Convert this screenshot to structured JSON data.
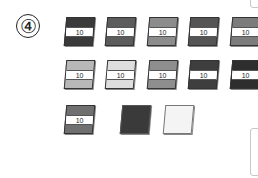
{
  "problem": {
    "number_label": "④"
  },
  "rows": [
    {
      "cards": [
        {
          "label": "10",
          "color": "#3a3a3a",
          "x": 65,
          "y": 17
        },
        {
          "label": "10",
          "color": "#5c5c5c",
          "x": 106,
          "y": 17
        },
        {
          "label": "10",
          "color": "#8c8c8c",
          "x": 148,
          "y": 17
        },
        {
          "label": "10",
          "color": "#555555",
          "x": 189,
          "y": 17
        },
        {
          "label": "10",
          "color": "#7c7c7c",
          "x": 231,
          "y": 17
        }
      ]
    },
    {
      "cards": [
        {
          "label": "10",
          "color": "#b8b8b8",
          "x": 65,
          "y": 60
        },
        {
          "label": "10",
          "color": "#dedede",
          "x": 106,
          "y": 60
        },
        {
          "label": "10",
          "color": "#8e8e8e",
          "x": 148,
          "y": 60
        },
        {
          "label": "10",
          "color": "#3e3e3e",
          "x": 189,
          "y": 60
        },
        {
          "label": "10",
          "color": "#2e2e2e",
          "x": 231,
          "y": 60
        }
      ]
    },
    {
      "cards": [
        {
          "label": "10",
          "color": "#707070",
          "x": 65,
          "y": 105
        },
        {
          "label": "",
          "color": "#3a3a3a",
          "x": 121,
          "y": 105
        },
        {
          "label": "",
          "color": "#f4f4f4",
          "x": 164,
          "y": 105
        }
      ]
    }
  ],
  "side_frames": [
    {
      "top": -6,
      "height": 14
    },
    {
      "top": 128,
      "height": 48
    }
  ]
}
